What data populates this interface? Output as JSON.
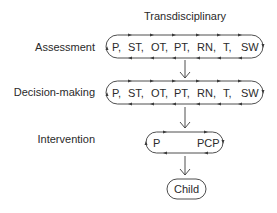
{
  "diagram": {
    "title": "Transdisciplinary",
    "stages": [
      {
        "label": "Assessment",
        "members": [
          "P,",
          "ST,",
          "OT,",
          "PT,",
          "RN,",
          "T,",
          "SW"
        ]
      },
      {
        "label": "Decision-making",
        "members": [
          "P,",
          "ST,",
          "OT,",
          "PT,",
          "RN,",
          "T,",
          "SW"
        ]
      },
      {
        "label": "Intervention",
        "members": [
          "P",
          "PCP"
        ]
      }
    ],
    "outcome": "Child",
    "colors": {
      "line": "#3a3a3a",
      "text": "#2a2a2a",
      "background": "#ffffff"
    }
  }
}
